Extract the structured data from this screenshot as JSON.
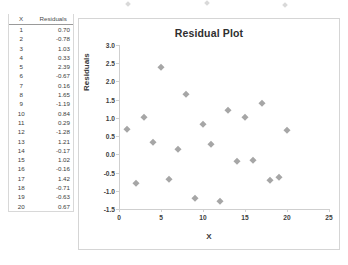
{
  "table": {
    "headers": [
      "X",
      "Residuals"
    ],
    "rows": [
      {
        "x": "1",
        "residual": "0.70"
      },
      {
        "x": "2",
        "residual": "-0.78"
      },
      {
        "x": "3",
        "residual": "1.03"
      },
      {
        "x": "4",
        "residual": "0.33"
      },
      {
        "x": "5",
        "residual": "2.39"
      },
      {
        "x": "6",
        "residual": "-0.67"
      },
      {
        "x": "7",
        "residual": "0.16"
      },
      {
        "x": "8",
        "residual": "1.65"
      },
      {
        "x": "9",
        "residual": "-1.19"
      },
      {
        "x": "10",
        "residual": "0.84"
      },
      {
        "x": "11",
        "residual": "0.29"
      },
      {
        "x": "12",
        "residual": "-1.28"
      },
      {
        "x": "13",
        "residual": "1.21"
      },
      {
        "x": "14",
        "residual": "-0.17"
      },
      {
        "x": "15",
        "residual": "1.02"
      },
      {
        "x": "16",
        "residual": "-0.16"
      },
      {
        "x": "17",
        "residual": "1.42"
      },
      {
        "x": "18",
        "residual": "-0.71"
      },
      {
        "x": "19",
        "residual": "-0.63"
      },
      {
        "x": "20",
        "residual": "0.67"
      }
    ]
  },
  "chart_data": {
    "type": "scatter",
    "title": "Residual Plot",
    "xlabel": "X",
    "ylabel": "Residuals",
    "xlim": [
      0,
      25
    ],
    "ylim": [
      -1.5,
      3.0
    ],
    "xticks": [
      "0",
      "5",
      "10",
      "15",
      "20",
      "25"
    ],
    "yticks": [
      "3.0",
      "2.5",
      "2.0",
      "1.5",
      "1.0",
      "0.5",
      "0.0",
      "-0.5",
      "-1.0",
      "-1.5"
    ],
    "grid": false,
    "legend": false,
    "marker": "diamond",
    "marker_color": "#a6a6a6",
    "x": [
      1,
      2,
      3,
      4,
      5,
      6,
      7,
      8,
      9,
      10,
      11,
      12,
      13,
      14,
      15,
      16,
      17,
      18,
      19,
      20
    ],
    "y": [
      0.7,
      -0.78,
      1.03,
      0.33,
      2.39,
      -0.67,
      0.16,
      1.65,
      -1.19,
      0.84,
      0.29,
      -1.28,
      1.21,
      -0.17,
      1.02,
      -0.16,
      1.42,
      -0.71,
      -0.63,
      0.67
    ]
  },
  "colors": {
    "marker": "#a6a6a6",
    "axis": "#cfcfcf",
    "text": "#3a3a3a"
  }
}
